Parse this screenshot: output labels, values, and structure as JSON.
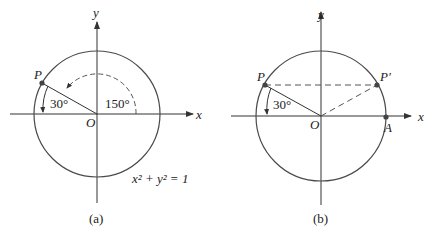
{
  "panels": [
    {
      "id": "a",
      "caption": "(a)",
      "x_axis_label": "x",
      "y_axis_label": "y",
      "origin_label": "O",
      "point_label": "P",
      "angle_small": "30°",
      "angle_large": "150°",
      "equation": "x² + y² = 1"
    },
    {
      "id": "b",
      "caption": "(b)",
      "x_axis_label": "x",
      "y_axis_label": "y",
      "origin_label": "O",
      "point_label": "P",
      "point_reflect_label": "P′",
      "point_a_label": "A",
      "angle_small": "30°"
    }
  ],
  "colors": {
    "axis": "#333333",
    "circle": "#4a4a4a",
    "point": "#444444",
    "dashed": "#555555"
  }
}
